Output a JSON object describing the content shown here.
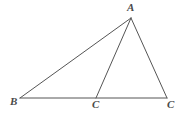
{
  "figure": {
    "type": "geometry-diagram",
    "shape": "triangle-with-cevian",
    "background_color": "#ffffff",
    "line_color": "#555555",
    "label_color": "#4a4a4a",
    "width": 191,
    "height": 113,
    "points": {
      "A": {
        "x": 131,
        "y": 18
      },
      "B": {
        "x": 20,
        "y": 98
      },
      "C1": {
        "x": 96,
        "y": 98
      },
      "C2": {
        "x": 167,
        "y": 98
      }
    },
    "segments": [
      {
        "name": "side-BA",
        "from": "B",
        "to": "A"
      },
      {
        "name": "side-AC2",
        "from": "A",
        "to": "C2"
      },
      {
        "name": "base-BC2",
        "from": "B",
        "to": "C2"
      },
      {
        "name": "cevian-AC1",
        "from": "A",
        "to": "C1"
      }
    ],
    "labels": {
      "A": "A",
      "B": "B",
      "C1": "C",
      "C2": "C"
    }
  }
}
